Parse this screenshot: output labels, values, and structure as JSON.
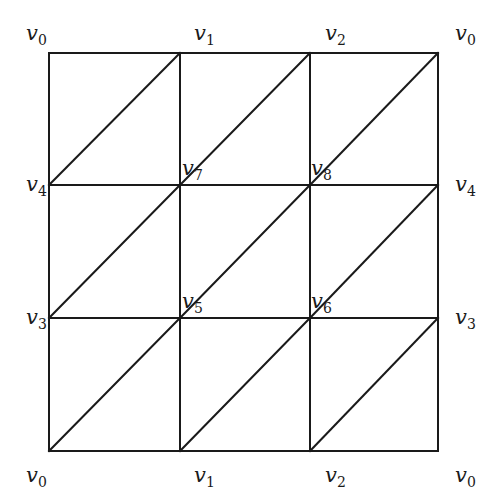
{
  "diagram": {
    "grid": {
      "cols_x": [
        49,
        180,
        310,
        438
      ],
      "rows_y": [
        53,
        185,
        318,
        451
      ],
      "line_color": "#1a1a1a"
    },
    "labels": [
      {
        "id": "top-v0-left",
        "base": "v",
        "sub": "0",
        "x": 26,
        "y": 40
      },
      {
        "id": "top-v1",
        "base": "v",
        "sub": "1",
        "x": 194,
        "y": 40
      },
      {
        "id": "top-v2",
        "base": "v",
        "sub": "2",
        "x": 325,
        "y": 40
      },
      {
        "id": "top-v0-right",
        "base": "v",
        "sub": "0",
        "x": 455,
        "y": 40
      },
      {
        "id": "left-v4",
        "base": "v",
        "sub": "4",
        "x": 26,
        "y": 191
      },
      {
        "id": "right-v4",
        "base": "v",
        "sub": "4",
        "x": 455,
        "y": 191
      },
      {
        "id": "inner-v7",
        "base": "v",
        "sub": "7",
        "x": 182,
        "y": 175
      },
      {
        "id": "inner-v8",
        "base": "v",
        "sub": "8",
        "x": 311,
        "y": 175
      },
      {
        "id": "left-v3",
        "base": "v",
        "sub": "3",
        "x": 26,
        "y": 324
      },
      {
        "id": "right-v3",
        "base": "v",
        "sub": "3",
        "x": 455,
        "y": 324
      },
      {
        "id": "inner-v5",
        "base": "v",
        "sub": "5",
        "x": 182,
        "y": 308
      },
      {
        "id": "inner-v6",
        "base": "v",
        "sub": "6",
        "x": 311,
        "y": 308
      },
      {
        "id": "bottom-v0-left",
        "base": "v",
        "sub": "0",
        "x": 26,
        "y": 482
      },
      {
        "id": "bottom-v1",
        "base": "v",
        "sub": "1",
        "x": 194,
        "y": 482
      },
      {
        "id": "bottom-v2",
        "base": "v",
        "sub": "2",
        "x": 325,
        "y": 482
      },
      {
        "id": "bottom-v0-right",
        "base": "v",
        "sub": "0",
        "x": 455,
        "y": 482
      }
    ]
  }
}
